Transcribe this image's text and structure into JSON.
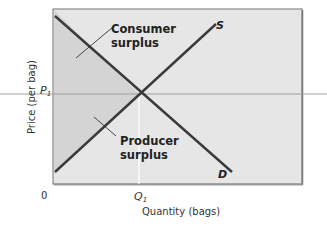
{
  "diagram": {
    "type": "supply-demand",
    "axes": {
      "x_label": "Quantity (bags)",
      "y_label": "Price (per bag)",
      "origin_label": "0",
      "x_marker": "Q",
      "x_marker_sub": "1",
      "y_marker": "P",
      "y_marker_sub": "1"
    },
    "curves": {
      "supply_label": "S",
      "demand_label": "D"
    },
    "regions": {
      "consumer_line1": "Consumer",
      "consumer_line2": "surplus",
      "producer_line1": "Producer",
      "producer_line2": "surplus"
    },
    "colors": {
      "plot_bg": "#e6e6e6",
      "surplus_fill": "#d5d5d5",
      "curve": "#3a3a3a",
      "frame": "#888888",
      "guide_line": "#9a9a9a",
      "q_guide": "#ffffff"
    }
  }
}
